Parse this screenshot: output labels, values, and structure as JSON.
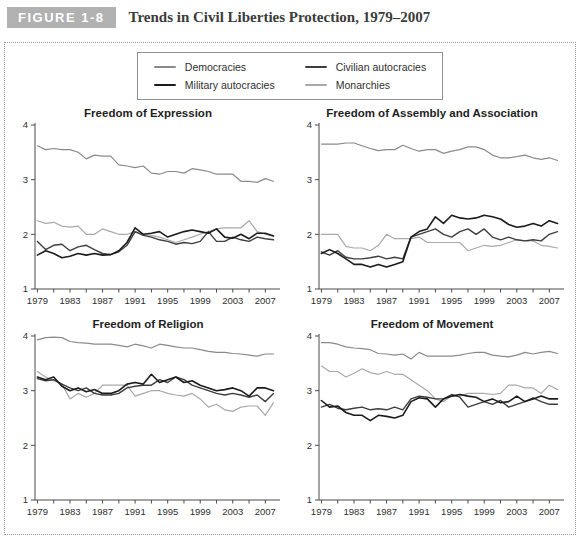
{
  "header": {
    "figure_label": "FIGURE 1-8",
    "title": "Trends in Civil Liberties Protection, 1979–2007"
  },
  "colors": {
    "figure_tag_bg": "#b1b1b1",
    "figure_tag_text": "#ffffff",
    "axis": "#4a4a4a",
    "dotted_border": "#9b9b9b"
  },
  "legend": {
    "items": [
      {
        "label": "Democracies",
        "color": "#8a8a8a",
        "weight": 1.2
      },
      {
        "label": "Military autocracies",
        "color": "#1c1c1c",
        "weight": 1.6
      },
      {
        "label": "Civilian autocracies",
        "color": "#3e3e3e",
        "weight": 1.4
      },
      {
        "label": "Monarchies",
        "color": "#a9a9a9",
        "weight": 1.2
      }
    ]
  },
  "chart_data": [
    {
      "type": "line",
      "title": "Freedom of Expression",
      "x": [
        1979,
        1980,
        1981,
        1982,
        1983,
        1984,
        1985,
        1986,
        1987,
        1988,
        1989,
        1990,
        1991,
        1992,
        1993,
        1994,
        1995,
        1996,
        1997,
        1998,
        1999,
        2000,
        2001,
        2002,
        2003,
        2004,
        2005,
        2006,
        2007,
        2008
      ],
      "xtick_labels": [
        1979,
        1983,
        1987,
        1991,
        1995,
        1999,
        2003,
        2007
      ],
      "xtick_minor_step": 2,
      "ylim": [
        1,
        4
      ],
      "yticks": [
        1,
        2,
        3,
        4
      ],
      "grid": false,
      "series": [
        {
          "name": "Democracies",
          "values": [
            3.62,
            3.55,
            3.57,
            3.55,
            3.55,
            3.5,
            3.38,
            3.45,
            3.43,
            3.43,
            3.27,
            3.25,
            3.22,
            3.25,
            3.12,
            3.1,
            3.15,
            3.15,
            3.12,
            3.2,
            3.18,
            3.15,
            3.1,
            3.1,
            3.1,
            2.97,
            2.97,
            2.95,
            3.02,
            2.97
          ]
        },
        {
          "name": "Military autocracies",
          "values": [
            1.62,
            1.7,
            1.65,
            1.57,
            1.6,
            1.65,
            1.62,
            1.65,
            1.62,
            1.63,
            1.7,
            1.85,
            2.12,
            2.0,
            2.02,
            2.05,
            1.95,
            2.0,
            2.05,
            2.08,
            2.05,
            2.02,
            2.1,
            1.95,
            1.93,
            2.0,
            1.92,
            2.02,
            2.02,
            1.97
          ]
        },
        {
          "name": "Civilian autocracies",
          "values": [
            1.87,
            1.72,
            1.8,
            1.82,
            1.7,
            1.77,
            1.8,
            1.72,
            1.65,
            1.63,
            1.68,
            1.8,
            2.05,
            1.98,
            1.95,
            1.9,
            1.87,
            1.82,
            1.85,
            1.83,
            1.87,
            2.05,
            1.87,
            1.87,
            1.95,
            1.9,
            1.87,
            1.95,
            1.92,
            1.9
          ]
        },
        {
          "name": "Monarchies",
          "values": [
            2.25,
            2.2,
            2.22,
            2.15,
            2.13,
            2.15,
            2.0,
            2.0,
            2.1,
            2.05,
            2.0,
            2.0,
            2.05,
            2.0,
            1.98,
            1.95,
            1.9,
            1.85,
            1.9,
            1.95,
            2.0,
            2.05,
            2.1,
            2.12,
            2.12,
            2.12,
            2.25,
            2.05,
            2.0,
            1.97
          ]
        }
      ]
    },
    {
      "type": "line",
      "title": "Freedom of Assembly and Association",
      "x": [
        1979,
        1980,
        1981,
        1982,
        1983,
        1984,
        1985,
        1986,
        1987,
        1988,
        1989,
        1990,
        1991,
        1992,
        1993,
        1994,
        1995,
        1996,
        1997,
        1998,
        1999,
        2000,
        2001,
        2002,
        2003,
        2004,
        2005,
        2006,
        2007,
        2008
      ],
      "xtick_labels": [
        1979,
        1983,
        1987,
        1991,
        1995,
        1999,
        2003,
        2007
      ],
      "xtick_minor_step": 2,
      "ylim": [
        1,
        4
      ],
      "yticks": [
        1,
        2,
        3,
        4
      ],
      "grid": false,
      "series": [
        {
          "name": "Democracies",
          "values": [
            3.65,
            3.65,
            3.65,
            3.67,
            3.67,
            3.62,
            3.57,
            3.53,
            3.55,
            3.55,
            3.63,
            3.57,
            3.52,
            3.55,
            3.55,
            3.48,
            3.52,
            3.55,
            3.6,
            3.6,
            3.55,
            3.45,
            3.4,
            3.4,
            3.42,
            3.45,
            3.4,
            3.37,
            3.4,
            3.35
          ]
        },
        {
          "name": "Military autocracies",
          "values": [
            1.65,
            1.72,
            1.65,
            1.55,
            1.45,
            1.45,
            1.4,
            1.45,
            1.4,
            1.45,
            1.5,
            1.95,
            2.05,
            2.1,
            2.32,
            2.2,
            2.35,
            2.3,
            2.28,
            2.3,
            2.35,
            2.32,
            2.28,
            2.18,
            2.13,
            2.15,
            2.2,
            2.15,
            2.25,
            2.2
          ]
        },
        {
          "name": "Civilian autocracies",
          "values": [
            1.68,
            1.62,
            1.7,
            1.58,
            1.55,
            1.55,
            1.57,
            1.6,
            1.55,
            1.58,
            1.55,
            1.95,
            2.0,
            2.05,
            2.1,
            2.0,
            1.95,
            2.05,
            2.1,
            2.0,
            2.1,
            1.95,
            1.9,
            1.95,
            1.9,
            1.88,
            1.9,
            1.88,
            2.0,
            2.05
          ]
        },
        {
          "name": "Monarchies",
          "values": [
            2.0,
            2.0,
            2.0,
            1.78,
            1.75,
            1.75,
            1.7,
            1.8,
            2.0,
            1.92,
            1.92,
            1.92,
            1.95,
            1.85,
            1.85,
            1.85,
            1.85,
            1.85,
            1.7,
            1.75,
            1.8,
            1.78,
            1.8,
            1.85,
            1.9,
            1.88,
            1.88,
            1.8,
            1.78,
            1.75
          ]
        }
      ]
    },
    {
      "type": "line",
      "title": "Freedom of Religion",
      "x": [
        1979,
        1980,
        1981,
        1982,
        1983,
        1984,
        1985,
        1986,
        1987,
        1988,
        1989,
        1990,
        1991,
        1992,
        1993,
        1994,
        1995,
        1996,
        1997,
        1998,
        1999,
        2000,
        2001,
        2002,
        2003,
        2004,
        2005,
        2006,
        2007,
        2008
      ],
      "xtick_labels": [
        1979,
        1983,
        1987,
        1991,
        1995,
        1999,
        2003,
        2007
      ],
      "xtick_minor_step": 2,
      "ylim": [
        1,
        4
      ],
      "yticks": [
        1,
        2,
        3,
        4
      ],
      "grid": false,
      "series": [
        {
          "name": "Democracies",
          "values": [
            3.93,
            3.97,
            3.98,
            3.97,
            3.9,
            3.88,
            3.87,
            3.85,
            3.85,
            3.85,
            3.83,
            3.8,
            3.85,
            3.82,
            3.78,
            3.85,
            3.83,
            3.8,
            3.78,
            3.78,
            3.75,
            3.72,
            3.7,
            3.7,
            3.68,
            3.67,
            3.65,
            3.63,
            3.67,
            3.67
          ]
        },
        {
          "name": "Military autocracies",
          "values": [
            3.25,
            3.2,
            3.25,
            3.08,
            3.0,
            3.05,
            2.98,
            3.02,
            2.95,
            2.95,
            3.0,
            3.12,
            3.15,
            3.12,
            3.3,
            3.15,
            3.2,
            3.25,
            3.15,
            3.18,
            3.1,
            3.05,
            3.0,
            3.02,
            3.05,
            3.0,
            2.9,
            3.05,
            3.05,
            3.0
          ]
        },
        {
          "name": "Civilian autocracies",
          "values": [
            3.22,
            3.18,
            3.2,
            3.12,
            3.05,
            3.0,
            3.05,
            2.95,
            2.92,
            2.92,
            2.95,
            3.05,
            3.08,
            3.1,
            3.1,
            3.2,
            3.15,
            3.25,
            3.2,
            3.1,
            3.05,
            3.0,
            2.95,
            2.92,
            2.95,
            2.92,
            2.88,
            2.92,
            2.8,
            2.95
          ]
        },
        {
          "name": "Monarchies",
          "values": [
            3.35,
            3.25,
            3.18,
            3.12,
            2.85,
            2.95,
            2.88,
            2.95,
            3.1,
            3.1,
            3.1,
            3.1,
            2.9,
            2.95,
            3.0,
            3.0,
            2.95,
            2.92,
            2.9,
            2.95,
            2.85,
            2.7,
            2.75,
            2.65,
            2.62,
            2.7,
            2.72,
            2.72,
            2.55,
            2.78
          ]
        }
      ]
    },
    {
      "type": "line",
      "title": "Freedom of Movement",
      "x": [
        1979,
        1980,
        1981,
        1982,
        1983,
        1984,
        1985,
        1986,
        1987,
        1988,
        1989,
        1990,
        1991,
        1992,
        1993,
        1994,
        1995,
        1996,
        1997,
        1998,
        1999,
        2000,
        2001,
        2002,
        2003,
        2004,
        2005,
        2006,
        2007,
        2008
      ],
      "xtick_labels": [
        1979,
        1983,
        1987,
        1991,
        1995,
        1999,
        2003,
        2007
      ],
      "xtick_minor_step": 2,
      "ylim": [
        1,
        4
      ],
      "yticks": [
        1,
        2,
        3,
        4
      ],
      "grid": false,
      "series": [
        {
          "name": "Democracies",
          "values": [
            3.88,
            3.88,
            3.85,
            3.8,
            3.78,
            3.77,
            3.75,
            3.68,
            3.67,
            3.65,
            3.67,
            3.58,
            3.7,
            3.63,
            3.63,
            3.63,
            3.63,
            3.65,
            3.68,
            3.7,
            3.7,
            3.65,
            3.63,
            3.62,
            3.65,
            3.7,
            3.67,
            3.7,
            3.72,
            3.68
          ]
        },
        {
          "name": "Military autocracies",
          "values": [
            2.82,
            2.7,
            2.72,
            2.6,
            2.55,
            2.55,
            2.45,
            2.55,
            2.53,
            2.5,
            2.55,
            2.8,
            2.87,
            2.85,
            2.7,
            2.85,
            2.9,
            2.93,
            2.9,
            2.88,
            2.8,
            2.85,
            2.78,
            2.8,
            2.9,
            2.8,
            2.85,
            2.9,
            2.85,
            2.85
          ]
        },
        {
          "name": "Civilian autocracies",
          "values": [
            2.7,
            2.75,
            2.68,
            2.65,
            2.68,
            2.7,
            2.65,
            2.67,
            2.65,
            2.7,
            2.65,
            2.85,
            2.9,
            2.88,
            2.85,
            2.85,
            2.93,
            2.88,
            2.7,
            2.75,
            2.8,
            2.75,
            2.82,
            2.7,
            2.75,
            2.8,
            2.87,
            2.8,
            2.75,
            2.75
          ]
        },
        {
          "name": "Monarchies",
          "values": [
            3.45,
            3.35,
            3.35,
            3.25,
            3.32,
            3.4,
            3.33,
            3.3,
            3.35,
            3.3,
            3.3,
            3.2,
            3.1,
            3.0,
            2.85,
            2.8,
            2.9,
            2.9,
            2.95,
            2.95,
            2.95,
            2.93,
            2.95,
            3.1,
            3.1,
            3.05,
            3.05,
            2.95,
            3.1,
            3.02
          ]
        }
      ]
    }
  ]
}
